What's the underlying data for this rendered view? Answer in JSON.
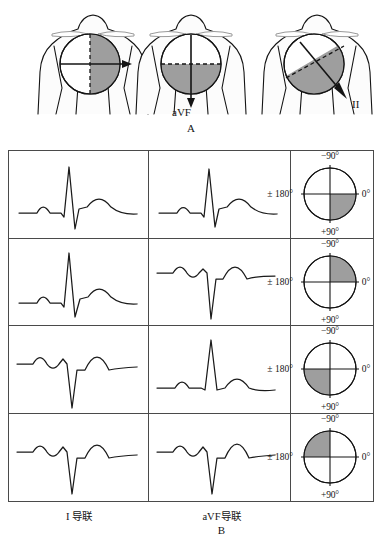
{
  "figure": {
    "panel_a": {
      "letter": "A",
      "diagrams": [
        {
          "name": "lead-I-vector",
          "arrow_label": "I",
          "divider": "vertical",
          "shaded_half": "right",
          "arrow_direction": "right"
        },
        {
          "name": "lead-aVF-vector",
          "arrow_label": "aVF",
          "divider": "horizontal",
          "shaded_half": "bottom",
          "arrow_direction": "down"
        },
        {
          "name": "lead-II-vector",
          "arrow_label": "II",
          "divider": "diagonal",
          "shaded_half": "lower-right",
          "arrow_direction": "down-right"
        }
      ]
    },
    "panel_b": {
      "letter": "B",
      "columns": [
        "I 导联",
        "aVF导联",
        ""
      ],
      "degree_labels": {
        "top": "−90°",
        "bottom": "+90°",
        "right": "0°",
        "left": "± 180°"
      },
      "rows": [
        {
          "name": "normal-axis",
          "lead1_qrs": "positive",
          "avf_qrs": "positive",
          "shaded_quadrant": "lower-right",
          "axis_range": "0° ~ +90°"
        },
        {
          "name": "left-axis-deviation",
          "lead1_qrs": "positive",
          "avf_qrs": "negative",
          "shaded_quadrant": "upper-right",
          "axis_range": "0° ~ −90°"
        },
        {
          "name": "right-axis-deviation",
          "lead1_qrs": "negative",
          "avf_qrs": "positive",
          "shaded_quadrant": "lower-left",
          "axis_range": "+90° ~ ±180°"
        },
        {
          "name": "extreme-axis-deviation",
          "lead1_qrs": "negative",
          "avf_qrs": "negative",
          "shaded_quadrant": "upper-left",
          "axis_range": "−90° ~ ±180°"
        }
      ]
    },
    "colors": {
      "shade": "#9e9e9e",
      "line": "#141414",
      "border": "#4a4a4a"
    }
  }
}
